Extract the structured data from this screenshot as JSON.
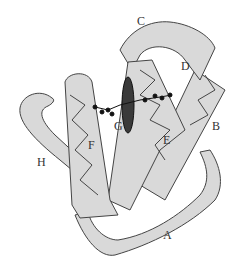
{
  "diagram": {
    "type": "protein ribbon diagram",
    "labels": [
      {
        "id": "A",
        "text": "A",
        "x": 163,
        "y": 235
      },
      {
        "id": "B",
        "text": "B",
        "x": 212,
        "y": 118
      },
      {
        "id": "C",
        "text": "C",
        "x": 137,
        "y": 15
      },
      {
        "id": "D",
        "text": "D",
        "x": 181,
        "y": 58
      },
      {
        "id": "E",
        "text": "E",
        "x": 163,
        "y": 133
      },
      {
        "id": "F",
        "text": "F",
        "x": 88,
        "y": 141
      },
      {
        "id": "G",
        "text": "G",
        "x": 112,
        "y": 118
      },
      {
        "id": "H",
        "text": "H",
        "x": 37,
        "y": 155
      }
    ],
    "colors": {
      "ribbon_fill": "#d9d9d9",
      "ribbon_stroke": "#444444",
      "heme": "#3a3a3a",
      "ligand": "#111111"
    }
  }
}
